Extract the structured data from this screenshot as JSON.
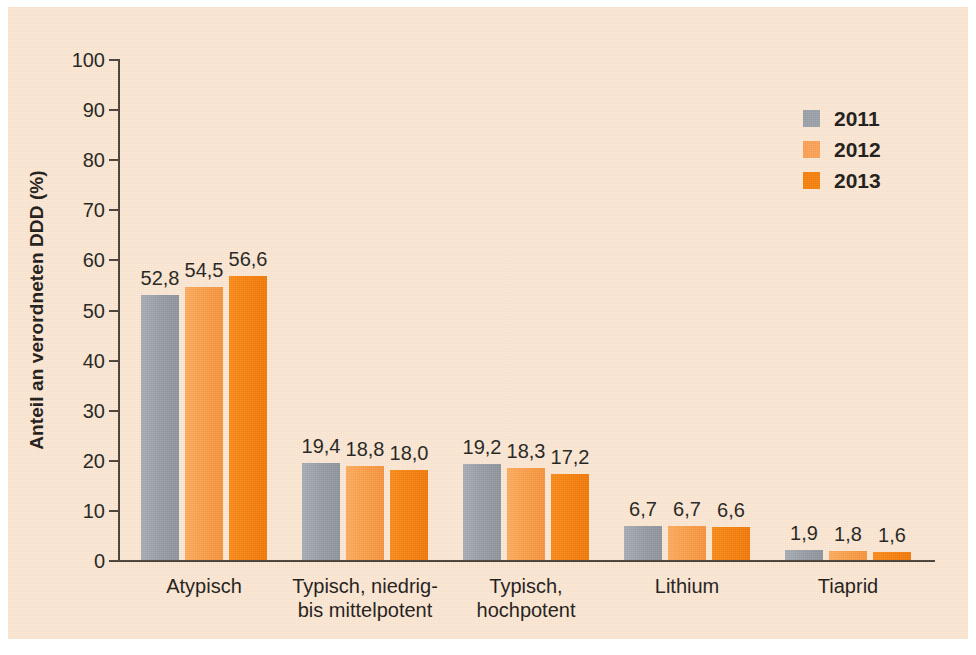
{
  "chart_data": {
    "type": "bar",
    "title": "",
    "subtitle": "",
    "xlabel": "",
    "ylabel": "Anteil an verordneten DDD (%)",
    "ylim": [
      0,
      100
    ],
    "ytick_step": 10,
    "yticks": [
      "100",
      "90",
      "80",
      "70",
      "60",
      "50",
      "40",
      "30",
      "20",
      "10",
      "0"
    ],
    "grid": false,
    "legend_position": "top-right",
    "categories": [
      "Atypisch",
      "Typisch, niedrig-\nbis mittelpotent",
      "Typisch,\nhochpotent",
      "Lithium",
      "Tiaprid"
    ],
    "series": [
      {
        "name": "2011",
        "color": "#9aa0a8",
        "values": [
          52.8,
          19.4,
          19.2,
          6.7,
          1.9
        ],
        "labels": [
          "52,8",
          "19,4",
          "19,2",
          "6,7",
          "1,9"
        ]
      },
      {
        "name": "2012",
        "color": "#fba055",
        "values": [
          54.5,
          18.8,
          18.3,
          6.7,
          1.8
        ],
        "labels": [
          "54,5",
          "18,8",
          "18,3",
          "6,7",
          "1,8"
        ]
      },
      {
        "name": "2013",
        "color": "#f67f0b",
        "values": [
          56.6,
          18.0,
          17.2,
          6.6,
          1.6
        ],
        "labels": [
          "56,6",
          "18,0",
          "17,2",
          "6,6",
          "1,6"
        ]
      }
    ]
  },
  "legend": {
    "items": [
      {
        "label": "2011",
        "color": "#9aa0a8"
      },
      {
        "label": "2012",
        "color": "#fba055"
      },
      {
        "label": "2013",
        "color": "#f67f0b"
      }
    ]
  },
  "colors": {
    "panel_background": "#fbe6d2",
    "page_background": "#ffffff",
    "axis": "#4a4036",
    "text": "#1c1917",
    "series_2011": "#9aa0a8",
    "series_2012": "#fba055",
    "series_2013": "#f67f0b"
  }
}
